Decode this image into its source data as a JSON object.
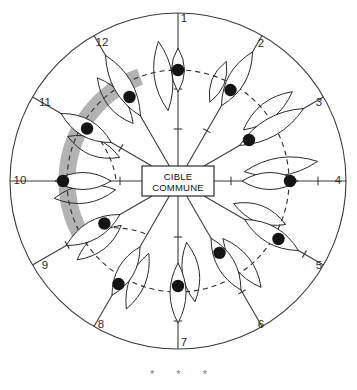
{
  "figure": {
    "title_text": "",
    "center_box": {
      "line1": "CIBLE",
      "line2": "COMMUNE"
    },
    "footer_marks": [
      "*",
      "*",
      "*"
    ],
    "colors": {
      "band": "#b3b3b3",
      "line": "#3a3a3a",
      "dot": "#141414",
      "background": "#ffffff",
      "number": "#2b2b2b",
      "asterisk": "#7a7a7a"
    }
  },
  "chart_data": {
    "type": "diagram",
    "subtype": "radial-spoke-target",
    "title": "CIBLE COMMUNE",
    "center_label": "CIBLE COMMUNE",
    "spoke_count": 12,
    "outer_circle": {
      "cx": 178,
      "cy": 181,
      "r": 168
    },
    "dashed_ring": {
      "cx": 178,
      "cy": 181,
      "r": 111
    },
    "band": {
      "cx": 178,
      "cy": 181,
      "r": 111,
      "stroke_width": 17,
      "start_angle_deg": 212,
      "end_angle_deg": 110,
      "description": "thick grey arc sweeping clockwise from lower-left through top to lower-middle"
    },
    "spokes": [
      {
        "label": "1",
        "angle_deg": 90,
        "label_x": 184,
        "label_y": 19,
        "dot_r": 111,
        "lens_r": 111,
        "lens_len": 44,
        "lens_w": 13,
        "has_dot": true,
        "ticks": [
          52,
          92
        ]
      },
      {
        "label": "2",
        "angle_deg": 60,
        "label_x": 261,
        "label_y": 44,
        "dot_r": 105,
        "lens_r": 118,
        "lens_len": 62,
        "lens_w": 17,
        "has_dot": true,
        "ticks": [
          58
        ]
      },
      {
        "label": "3",
        "angle_deg": 30,
        "label_x": 319,
        "label_y": 103,
        "dot_r": 82,
        "lens_r": 108,
        "lens_len": 74,
        "lens_w": 18,
        "has_dot": true,
        "ticks": []
      },
      {
        "label": "4",
        "angle_deg": 0,
        "label_x": 338,
        "label_y": 181,
        "dot_r": 112,
        "lens_r": 92,
        "lens_len": 56,
        "lens_w": 17,
        "has_dot": true,
        "ticks": [
          53,
          140
        ]
      },
      {
        "label": "5",
        "angle_deg": -30,
        "label_x": 319,
        "label_y": 266,
        "dot_r": 116,
        "lens_r": 108,
        "lens_len": 62,
        "lens_w": 17,
        "has_dot": true,
        "ticks": [
          146
        ]
      },
      {
        "label": "6",
        "angle_deg": -60,
        "label_x": 261,
        "label_y": 325,
        "dot_r": 83,
        "lens_r": 96,
        "lens_len": 60,
        "lens_w": 17,
        "has_dot": true,
        "ticks": [
          128
        ]
      },
      {
        "label": "7",
        "angle_deg": -90,
        "label_x": 184,
        "label_y": 343,
        "dot_r": 105,
        "lens_r": 112,
        "lens_len": 60,
        "lens_w": 16,
        "has_dot": true,
        "ticks": [
          56,
          140
        ]
      },
      {
        "label": "8",
        "angle_deg": -120,
        "label_x": 101,
        "label_y": 325,
        "dot_r": 119,
        "lens_r": 104,
        "lens_len": 56,
        "lens_w": 16,
        "has_dot": true,
        "ticks": [
          92
        ]
      },
      {
        "label": "9",
        "angle_deg": -150,
        "label_x": 45,
        "label_y": 266,
        "dot_r": 85,
        "lens_r": 98,
        "lens_len": 62,
        "lens_w": 18,
        "has_dot": true,
        "ticks": [
          128
        ]
      },
      {
        "label": "10",
        "angle_deg": 180,
        "label_x": 20,
        "label_y": 181,
        "dot_r": 115,
        "lens_r": 95,
        "lens_len": 56,
        "lens_w": 17,
        "has_dot": true,
        "ticks": [
          58,
          118
        ]
      },
      {
        "label": "11",
        "angle_deg": 150,
        "label_x": 45,
        "label_y": 103,
        "dot_r": 105,
        "lens_r": 106,
        "lens_len": 58,
        "lens_w": 17,
        "has_dot": true,
        "ticks": [
          66
        ]
      },
      {
        "label": "12",
        "angle_deg": 120,
        "label_x": 102,
        "label_y": 43,
        "dot_r": 97,
        "lens_r": 110,
        "lens_len": 70,
        "lens_w": 18,
        "has_dot": true,
        "ticks": []
      }
    ],
    "inner_dashed_links": [
      {
        "from_angle_deg": 150,
        "to_angle_deg": 180,
        "note": "short dashed connector near spoke 11 / 10"
      },
      {
        "from_angle_deg": -150,
        "to_angle_deg": -120,
        "note": "short dashed connector near spoke 9 / 8"
      }
    ]
  }
}
